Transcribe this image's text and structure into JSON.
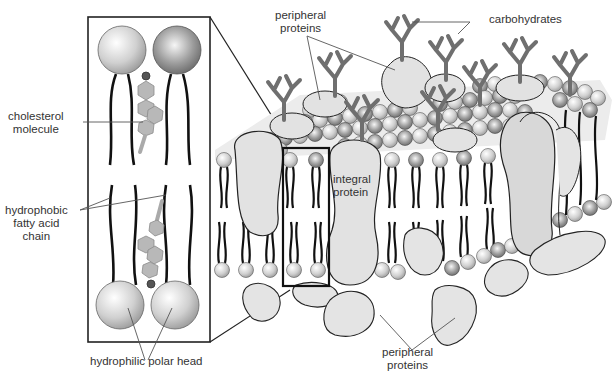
{
  "diagram": {
    "labels": {
      "cholesterol": [
        "cholesterol",
        "molecule"
      ],
      "fatty_acid": [
        "hydrophobic",
        "fatty acid",
        "chain"
      ],
      "polar_head": "hydrophilic polar head",
      "peripheral_top": [
        "peripheral",
        "proteins"
      ],
      "carbohydrates": "carbohydrates",
      "integral": [
        "integral",
        "protein"
      ],
      "peripheral_bottom": [
        "peripheral",
        "proteins"
      ]
    },
    "colors": {
      "protein_fill": "#e2e2e2",
      "carbohydrate": "#6f6f6f",
      "head_light": "#f2f2f2",
      "head_dark": "#8a8a8a",
      "cholesterol": "#b5b5b5",
      "line": "#222222",
      "label_line": "#555555"
    }
  }
}
